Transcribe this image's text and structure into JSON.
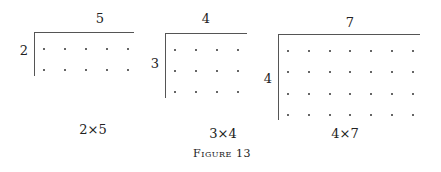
{
  "figure": {
    "caption": "Figure 13",
    "arrays": [
      {
        "rows": 2,
        "cols": 5,
        "top_label": "5",
        "side_label": "2",
        "caption": "2×5"
      },
      {
        "rows": 3,
        "cols": 4,
        "top_label": "4",
        "side_label": "3",
        "caption": "3×4"
      },
      {
        "rows": 4,
        "cols": 7,
        "top_label": "7",
        "side_label": "4",
        "caption": "4×7"
      }
    ]
  }
}
